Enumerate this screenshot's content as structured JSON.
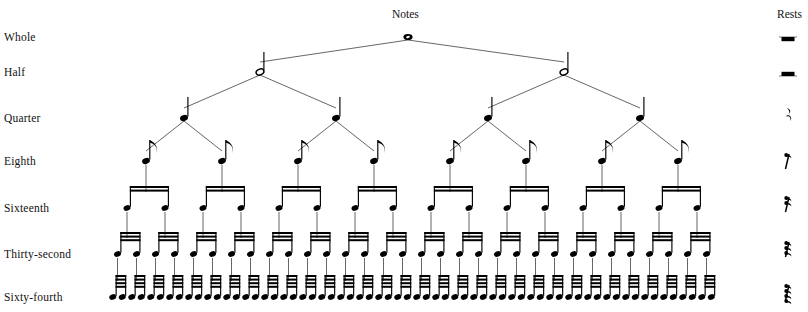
{
  "headers": {
    "notes": "Notes",
    "rests": "Rests"
  },
  "rows": [
    {
      "label": "Whole",
      "count": 1,
      "rest_icon": "whole-rest-icon",
      "y": 37
    },
    {
      "label": "Half",
      "count": 2,
      "rest_icon": "half-rest-icon",
      "y": 72
    },
    {
      "label": "Quarter",
      "count": 4,
      "rest_icon": "quarter-rest-icon",
      "y": 118
    },
    {
      "label": "Eighth",
      "count": 8,
      "rest_icon": "eighth-rest-icon",
      "y": 161
    },
    {
      "label": "Sixteenth",
      "count": 16,
      "rest_icon": "sixteenth-rest-icon",
      "y": 208
    },
    {
      "label": "Thirty-second",
      "count": 32,
      "rest_icon": "thirty-second-rest-icon",
      "y": 254
    },
    {
      "label": "Sixty-fourth",
      "count": 64,
      "rest_icon": "sixty-fourth-rest-icon",
      "y": 297
    }
  ],
  "chart_data": {
    "type": "diagram",
    "title": "Notes",
    "subtitle": "Rests",
    "levels": [
      {
        "name": "Whole",
        "notes_per_level": 1,
        "relative_duration": 1,
        "flags_or_beams": 0,
        "notehead": "hollow-no-stem"
      },
      {
        "name": "Half",
        "notes_per_level": 2,
        "relative_duration": 0.5,
        "flags_or_beams": 0,
        "notehead": "hollow-stem"
      },
      {
        "name": "Quarter",
        "notes_per_level": 4,
        "relative_duration": 0.25,
        "flags_or_beams": 0,
        "notehead": "filled-stem"
      },
      {
        "name": "Eighth",
        "notes_per_level": 8,
        "relative_duration": 0.125,
        "flags_or_beams": 1,
        "notehead": "filled-flag"
      },
      {
        "name": "Sixteenth",
        "notes_per_level": 16,
        "relative_duration": 0.0625,
        "flags_or_beams": 2,
        "notehead": "filled-beamed-pairs"
      },
      {
        "name": "Thirty-second",
        "notes_per_level": 32,
        "relative_duration": 0.03125,
        "flags_or_beams": 3,
        "notehead": "filled-beamed-pairs"
      },
      {
        "name": "Sixty-fourth",
        "notes_per_level": 64,
        "relative_duration": 0.015625,
        "flags_or_beams": 4,
        "notehead": "filled-beamed-pairs"
      }
    ],
    "axis_labels": {
      "left": "note value name",
      "right": "corresponding rest symbol"
    },
    "colors": {
      "ink": "#000000",
      "branch": "#333333",
      "background": "#ffffff"
    }
  }
}
